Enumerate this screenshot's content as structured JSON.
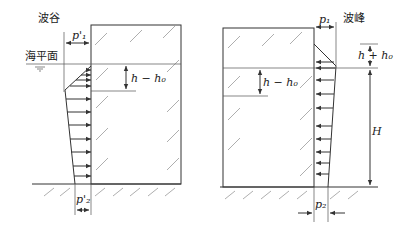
{
  "left": {
    "title": "波谷",
    "sea_level_label": "海平面",
    "p_top_label": "p'₁",
    "depth_label": "h − h₀",
    "p_bottom_label": "p'₂"
  },
  "right": {
    "title": "波峰",
    "p_top_label": "p₁",
    "rise_label": "h + h₀",
    "depth_label": "h − h₀",
    "height_label": "H",
    "p_bottom_label": "p₂"
  },
  "colors": {
    "line": "#333333",
    "hatch": "#999999",
    "background": "#ffffff"
  }
}
